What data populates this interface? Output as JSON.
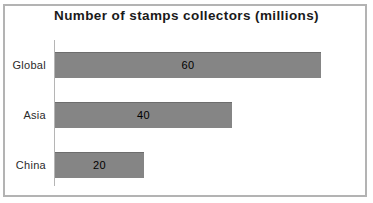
{
  "window": {
    "background": "#ffffff",
    "frame_border_color": "#b3b3b3"
  },
  "chart_data": {
    "type": "bar",
    "orientation": "horizontal",
    "title": "Number of stamps collectors (millions)",
    "categories": [
      "Global",
      "Asia",
      "China"
    ],
    "values": [
      60,
      40,
      20
    ],
    "value_labels": [
      "60",
      "40",
      "20"
    ],
    "xlim": [
      0,
      70
    ],
    "xlabel": "",
    "ylabel": "",
    "grid": false,
    "legend": false,
    "bar_color": "#858585",
    "value_label_color": "#000000",
    "axis_line_color": "#b5b5b5",
    "title_color": "#1a1a1a",
    "category_label_color": "#2b2b2b"
  }
}
